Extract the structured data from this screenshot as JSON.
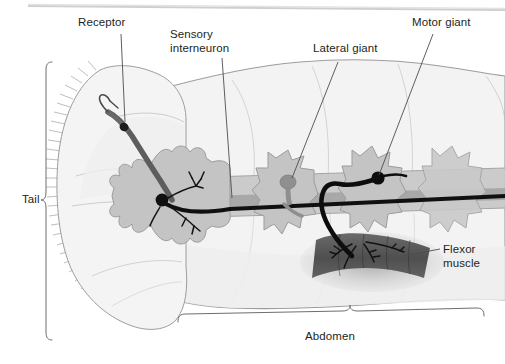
{
  "figure": {
    "background_color": "#ffffff",
    "width": 505,
    "height": 364
  },
  "labels": {
    "receptor": "Receptor",
    "sensory_interneuron_line1": "Sensory",
    "sensory_interneuron_line2": "interneuron",
    "lateral_giant": "Lateral giant",
    "motor_giant": "Motor giant",
    "flexor_muscle_line1": "Flexor",
    "flexor_muscle_line2": "muscle",
    "tail": "Tail",
    "abdomen": "Abdomen"
  },
  "colors": {
    "text": "#231f20",
    "leader_line": "#4d4d4f",
    "body_outline": "#8a8a8d",
    "body_fill": "#f2f2f2",
    "body_fill_dark": "#e8e8e8",
    "ganglion_fill": "#c6c6c6",
    "ganglion_outline": "#9a9a9a",
    "nerve_cord": "#8c8c8c",
    "dark_neuron": "#1a1a1a",
    "receptor_neuron": "#5a5a5a",
    "muscle_fill": "#585858",
    "muscle_shadow": "#9b9b9b",
    "bracket": "#6e6e70",
    "scan_edge": "#c9c9cb"
  },
  "structures": {
    "tail_fan": "fan-shaped tail with bristle fringe",
    "receptor_neuron": "receptor sensory neuron in tail fan",
    "sensory_interneuron": "sensory interneuron soma in terminal ganglion",
    "lateral_giant": "lateral giant interneuron soma on middle ganglion",
    "motor_giant": "motor giant neuron soma with axon to flexor muscle",
    "flexor_muscle": "dark banded flexor muscle block",
    "nerve_cord": "ventral nerve cord connecting ganglia",
    "ganglia_count": 4
  }
}
